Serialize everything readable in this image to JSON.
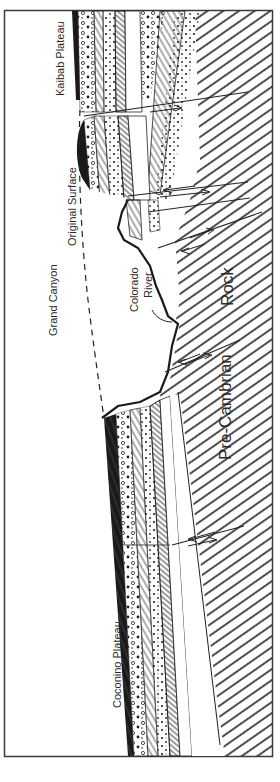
{
  "diagram": {
    "orientation": "rotated 90 degrees counter-clockwise",
    "labels": {
      "kaibab": "Kaibab Plateau",
      "original_surface": "Original Surface",
      "grand_canyon": "Grand Canyon",
      "colorado": "Colorado",
      "river": "River",
      "rock": "Rock",
      "precambrian": "Pre-Cambrian",
      "coconino": "Coconino Plateau"
    },
    "colors": {
      "ink": "#1e1e1e",
      "paper": "#ffffff",
      "frame": "#3a3a3a"
    }
  }
}
